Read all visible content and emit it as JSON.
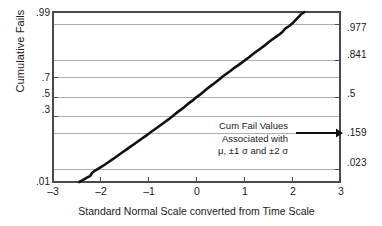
{
  "chart_data": {
    "type": "scatter",
    "title": "",
    "xlabel": "Standard Normal Scale converted from Time Scale",
    "ylabel": "Cumulative Fails",
    "xlim": [
      -3,
      3
    ],
    "ylim": [
      0.01,
      0.99
    ],
    "y_scale": "normal-probability",
    "grid": true,
    "legend_position": "none",
    "x_ticks": [
      "-3",
      "-2",
      "-1",
      "0",
      "1",
      "2",
      "3"
    ],
    "x_tick_values": [
      -3,
      -2,
      -1,
      0,
      1,
      2,
      3
    ],
    "y_ticks_left": [
      ".99",
      ".7",
      ".5",
      ".3",
      ".01"
    ],
    "y_tick_values_left": [
      0.99,
      0.7,
      0.5,
      0.3,
      0.01
    ],
    "y_ticks_right": [
      ".977",
      ".841",
      ".5",
      ".159",
      ".023"
    ],
    "y_tick_values_right": [
      0.977,
      0.841,
      0.5,
      0.159,
      0.023
    ],
    "gridline_values": [
      0.977,
      0.841,
      0.7,
      0.5,
      0.3,
      0.159,
      0.023
    ],
    "series": [
      {
        "name": "Cumulative fails",
        "x": [
          -2.45,
          -2.38,
          -2.3,
          -2.22,
          -2.18,
          -2.12,
          -2.05,
          -1.95,
          -1.86,
          -1.78,
          -1.7,
          -1.62,
          -1.54,
          -1.46,
          -1.38,
          -1.3,
          -1.22,
          -1.14,
          -1.06,
          -0.98,
          -0.9,
          -0.82,
          -0.74,
          -0.66,
          -0.58,
          -0.5,
          -0.42,
          -0.34,
          -0.26,
          -0.18,
          -0.1,
          -0.02,
          0.06,
          0.14,
          0.22,
          0.3,
          0.38,
          0.46,
          0.54,
          0.62,
          0.7,
          0.78,
          0.86,
          0.94,
          1.02,
          1.1,
          1.18,
          1.26,
          1.34,
          1.42,
          1.5,
          1.58,
          1.66,
          1.74,
          1.8,
          1.86,
          1.94,
          2.02,
          2.1,
          2.18,
          2.26
        ],
        "y": [
          0.01,
          0.0115,
          0.0135,
          0.0155,
          0.019,
          0.022,
          0.025,
          0.03,
          0.036,
          0.042,
          0.049,
          0.057,
          0.066,
          0.076,
          0.087,
          0.099,
          0.113,
          0.128,
          0.144,
          0.162,
          0.181,
          0.202,
          0.224,
          0.247,
          0.272,
          0.3,
          0.33,
          0.36,
          0.39,
          0.425,
          0.455,
          0.49,
          0.52,
          0.555,
          0.59,
          0.62,
          0.65,
          0.68,
          0.71,
          0.735,
          0.76,
          0.785,
          0.805,
          0.825,
          0.845,
          0.862,
          0.88,
          0.895,
          0.908,
          0.92,
          0.932,
          0.942,
          0.95,
          0.957,
          0.963,
          0.97,
          0.974,
          0.979,
          0.984,
          0.988,
          0.992
        ]
      }
    ],
    "annotations": [
      {
        "name": "cum-fail-note",
        "lines": [
          "Cum Fail Values",
          "Associated with",
          "μ, ±1 σ and ±2 σ"
        ],
        "arrow": "right-arrow"
      }
    ]
  },
  "axes": {
    "y_title": "Cumulative Fails",
    "x_title": "Standard Normal Scale converted from Time Scale",
    "left_ticks": [
      {
        "label": ".99",
        "value": 0.99
      },
      {
        "label": ".7",
        "value": 0.7
      },
      {
        "label": ".5",
        "value": 0.5
      },
      {
        "label": ".3",
        "value": 0.3
      },
      {
        "label": ".01",
        "value": 0.01
      }
    ],
    "right_ticks": [
      {
        "label": ".977",
        "value": 0.977
      },
      {
        "label": ".841",
        "value": 0.841
      },
      {
        "label": ".5",
        "value": 0.5
      },
      {
        "label": ".159",
        "value": 0.159
      },
      {
        "label": ".023",
        "value": 0.023
      }
    ],
    "bottom_ticks": [
      {
        "label": "–3",
        "value": -3
      },
      {
        "label": "–2",
        "value": -2
      },
      {
        "label": "–1",
        "value": -1
      },
      {
        "label": "0",
        "value": 0
      },
      {
        "label": "1",
        "value": 1
      },
      {
        "label": "2",
        "value": 2
      },
      {
        "label": "3",
        "value": 3
      }
    ]
  },
  "annotation": {
    "line1": "Cum Fail Values",
    "line2": "Associated with",
    "line3": "μ, ±1 σ and ±2 σ"
  },
  "colors": {
    "data": "#111111",
    "grid": "#9a9a9a",
    "axis": "#4a4a4a",
    "text": "#1a1a1a",
    "background": "#ffffff"
  }
}
